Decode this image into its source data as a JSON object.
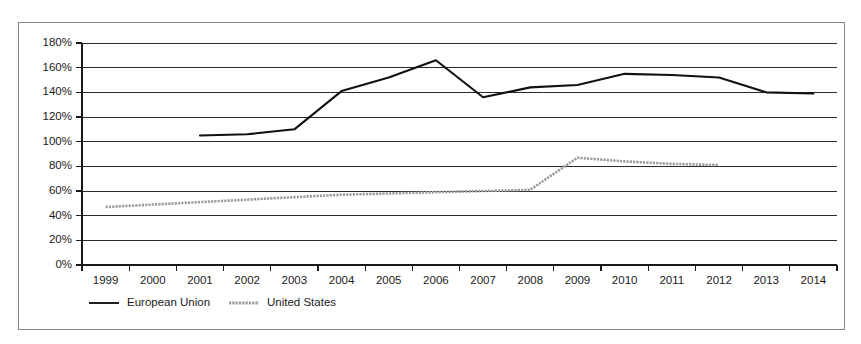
{
  "chart_data": {
    "type": "line",
    "title": "",
    "xlabel": "",
    "ylabel": "",
    "grid": true,
    "legend_position": "bottom-left",
    "x": [
      "1999",
      "2000",
      "2001",
      "2002",
      "2003",
      "2004",
      "2005",
      "2006",
      "2007",
      "2008",
      "2009",
      "2010",
      "2011",
      "2012",
      "2013",
      "2014"
    ],
    "ylim": [
      0,
      180
    ],
    "yticks": [
      0,
      20,
      40,
      60,
      80,
      100,
      120,
      140,
      160,
      180
    ],
    "ytick_labels": [
      "0%",
      "20%",
      "40%",
      "60%",
      "80%",
      "100%",
      "120%",
      "140%",
      "160%",
      "180%"
    ],
    "series": [
      {
        "name": "European Union",
        "color": "#111111",
        "style": "solid",
        "values": [
          null,
          null,
          105,
          106,
          110,
          141,
          152,
          166,
          136,
          144,
          146,
          155,
          154,
          152,
          140,
          139
        ]
      },
      {
        "name": "United States",
        "color": "#9b9b9b",
        "style": "dotted",
        "values": [
          47,
          49,
          51,
          53,
          55,
          57,
          58,
          59,
          60,
          61,
          87,
          84,
          82,
          81,
          null,
          null
        ]
      }
    ]
  },
  "legend": {
    "items": [
      {
        "label": "European Union",
        "marker": "solid-line-swatch"
      },
      {
        "label": "United States",
        "marker": "dotted-line-swatch"
      }
    ]
  },
  "colors": {
    "european_union": "#111111",
    "united_states": "#9b9b9b",
    "gridline": "#2b2b2b",
    "frame_border": "#8a8a8a",
    "background": "#ffffff",
    "text": "#1a1a1a"
  }
}
